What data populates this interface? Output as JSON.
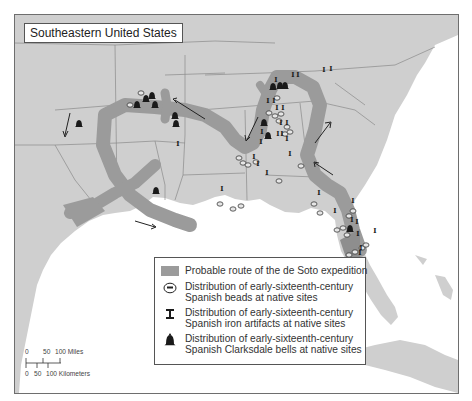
{
  "map": {
    "title": "Southeastern United States",
    "colors": {
      "land": "#cfcfcf",
      "water": "#ffffff",
      "route": "#9b9b9b",
      "borders": "#8a8a8a",
      "symbols": "#1a1a1a"
    }
  },
  "legend": {
    "items": [
      {
        "symbol": "route-swatch",
        "line1": "Probable route of the de Soto expedition",
        "line2": ""
      },
      {
        "symbol": "bead-icon",
        "line1": "Distribution of early-sixteenth-century",
        "line2": "Spanish beads at native sites"
      },
      {
        "symbol": "iron-artifact-icon",
        "line1": "Distribution of early-sixteenth-century",
        "line2": "Spanish iron artifacts at native sites"
      },
      {
        "symbol": "bell-icon",
        "line1": "Distribution of early-sixteenth-century",
        "line2": "Spanish Clarksdale bells at native sites"
      }
    ]
  },
  "scale_bar": {
    "miles_labels": [
      "0",
      "50",
      "100 Miles"
    ],
    "km_labels": [
      "0",
      "50",
      "100 Kilometers"
    ]
  }
}
